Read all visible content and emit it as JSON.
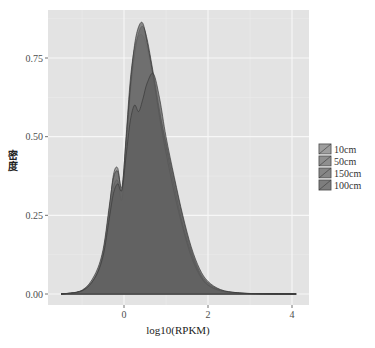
{
  "chart_data": {
    "type": "area",
    "subtype": "density",
    "title": "",
    "xlabel": "log10(RPKM)",
    "ylabel": "密度",
    "xlim": [
      -1.5,
      4.2
    ],
    "ylim": [
      -0.04,
      0.88
    ],
    "x_ticks": [
      0,
      2,
      4
    ],
    "x_tick_labels": [
      "0",
      "2",
      "4"
    ],
    "y_ticks": [
      0.0,
      0.25,
      0.5,
      0.75
    ],
    "y_tick_labels": [
      "0.00",
      "0.25",
      "0.50",
      "0.75"
    ],
    "grid": true,
    "legend": {
      "position": "right",
      "entries": [
        "10cm",
        "50cm",
        "150cm",
        "100cm"
      ]
    },
    "series": [
      {
        "name": "10cm",
        "color": "#8a8a8a",
        "x": [
          -1.5,
          -1.0,
          -0.7,
          -0.5,
          -0.35,
          -0.25,
          -0.15,
          -0.05,
          0.05,
          0.15,
          0.25,
          0.35,
          0.45,
          0.55,
          0.7,
          0.85,
          1.0,
          1.2,
          1.4,
          1.6,
          1.8,
          2.0,
          2.3,
          2.7,
          3.2,
          4.1
        ],
        "y": [
          0.0,
          0.01,
          0.05,
          0.13,
          0.27,
          0.38,
          0.4,
          0.33,
          0.5,
          0.68,
          0.78,
          0.82,
          0.82,
          0.78,
          0.68,
          0.57,
          0.48,
          0.36,
          0.24,
          0.14,
          0.07,
          0.035,
          0.012,
          0.004,
          0.001,
          0.0
        ]
      },
      {
        "name": "50cm",
        "color": "#767676",
        "x": [
          -1.5,
          -1.0,
          -0.7,
          -0.5,
          -0.35,
          -0.25,
          -0.15,
          -0.05,
          0.05,
          0.15,
          0.25,
          0.35,
          0.45,
          0.55,
          0.7,
          0.85,
          1.0,
          1.2,
          1.4,
          1.6,
          1.8,
          2.0,
          2.3,
          2.7,
          3.2,
          4.1
        ],
        "y": [
          0.0,
          0.01,
          0.05,
          0.12,
          0.25,
          0.34,
          0.36,
          0.3,
          0.46,
          0.64,
          0.76,
          0.83,
          0.85,
          0.81,
          0.7,
          0.58,
          0.47,
          0.34,
          0.22,
          0.13,
          0.065,
          0.03,
          0.01,
          0.003,
          0.001,
          0.0
        ]
      },
      {
        "name": "150cm",
        "color": "#6a6a6a",
        "x": [
          -1.5,
          -1.0,
          -0.7,
          -0.5,
          -0.35,
          -0.25,
          -0.15,
          -0.05,
          0.05,
          0.15,
          0.25,
          0.35,
          0.45,
          0.55,
          0.7,
          0.85,
          1.0,
          1.2,
          1.4,
          1.6,
          1.8,
          2.0,
          2.3,
          2.7,
          3.2,
          4.1
        ],
        "y": [
          0.0,
          0.012,
          0.06,
          0.14,
          0.28,
          0.37,
          0.39,
          0.34,
          0.49,
          0.66,
          0.79,
          0.85,
          0.86,
          0.8,
          0.69,
          0.56,
          0.45,
          0.32,
          0.21,
          0.12,
          0.06,
          0.028,
          0.01,
          0.003,
          0.001,
          0.0
        ]
      },
      {
        "name": "100cm",
        "color": "#5e5e5e",
        "x": [
          -1.5,
          -1.0,
          -0.7,
          -0.5,
          -0.35,
          -0.25,
          -0.15,
          -0.05,
          0.05,
          0.15,
          0.25,
          0.35,
          0.45,
          0.55,
          0.7,
          0.85,
          1.0,
          1.2,
          1.4,
          1.6,
          1.8,
          2.0,
          2.3,
          2.7,
          3.2,
          4.1
        ],
        "y": [
          0.0,
          0.01,
          0.05,
          0.12,
          0.24,
          0.32,
          0.35,
          0.33,
          0.44,
          0.55,
          0.6,
          0.58,
          0.62,
          0.67,
          0.7,
          0.62,
          0.5,
          0.37,
          0.25,
          0.15,
          0.08,
          0.04,
          0.014,
          0.004,
          0.001,
          0.0
        ]
      }
    ]
  }
}
